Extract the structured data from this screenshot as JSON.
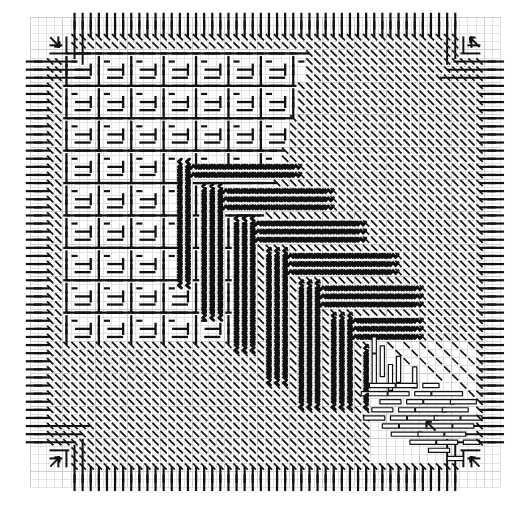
{
  "figure": {
    "title": "",
    "background_color": "#ffffff",
    "ink_color": "#111111",
    "grid_color": "#cfcfcf",
    "grid_minor_color": "#e2e2e2",
    "frame": {
      "x": 30,
      "y": 17,
      "width": 470,
      "height": 470
    },
    "grid": {
      "cols": 58,
      "rows": 58,
      "cell": 8.1
    }
  },
  "chart_data": {
    "type": "heatmap",
    "title": "",
    "subtitle": "",
    "xlabel": "",
    "ylabel": "",
    "grid": true,
    "legend_position": "none",
    "xlim": [
      0,
      58
    ],
    "ylim": [
      0,
      58
    ],
    "categories": [
      "border-vertical",
      "border-horizontal",
      "corner-arrow",
      "maze-glyph",
      "wavy-staircase",
      "diagonal-hatch",
      "hollow-bar"
    ],
    "values": [
      116,
      116,
      4,
      812,
      196,
      1784,
      28
    ],
    "series": [
      {
        "name": "marks per zone",
        "values": [
          116,
          116,
          4,
          812,
          196,
          1784,
          28
        ]
      }
    ],
    "zones": [
      {
        "name": "border-vertical",
        "mark": "vertical dash",
        "angle_deg": 90,
        "stroke": 2.2,
        "length": 17,
        "filled": true,
        "count": 116
      },
      {
        "name": "border-horizontal",
        "mark": "horizontal dash",
        "angle_deg": 0,
        "stroke": 2.2,
        "length": 17,
        "filled": true,
        "count": 116
      },
      {
        "name": "corner-arrow",
        "mark": "diagonal arrow",
        "angle_deg": 45,
        "stroke": 2.0,
        "length": 14,
        "filled": true,
        "count": 4
      },
      {
        "name": "maze-glyph",
        "mark": "orthogonal dash pair",
        "angle_deg": 0,
        "stroke": 2.4,
        "length": 14,
        "filled": true,
        "count": 812
      },
      {
        "name": "wavy-staircase",
        "mark": "zigzag stroke",
        "angle_deg": 0,
        "stroke": 3.0,
        "length": 16,
        "filled": true,
        "count": 196
      },
      {
        "name": "diagonal-hatch",
        "mark": "45 degree dash",
        "angle_deg": 45,
        "stroke": 1.8,
        "length": 9,
        "filled": true,
        "count": 1784
      },
      {
        "name": "hollow-bar",
        "mark": "outlined bar",
        "angle_deg": 0,
        "stroke": 1.2,
        "length": 22,
        "filled": false,
        "count": 28
      }
    ],
    "corner_arrows": [
      {
        "position": "top-left",
        "direction": "down-right",
        "cell": [
          1,
          1
        ]
      },
      {
        "position": "top-right",
        "direction": "up-left",
        "cell": [
          56,
          1
        ]
      },
      {
        "position": "bottom-left",
        "direction": "up-right",
        "cell": [
          1,
          56
        ]
      },
      {
        "position": "bottom-right",
        "direction": "up-left",
        "cell": [
          56,
          56
        ]
      }
    ],
    "inner_arrow": {
      "position": "lower-right-inner",
      "direction": "up-left",
      "cell": [
        49,
        50
      ]
    }
  }
}
